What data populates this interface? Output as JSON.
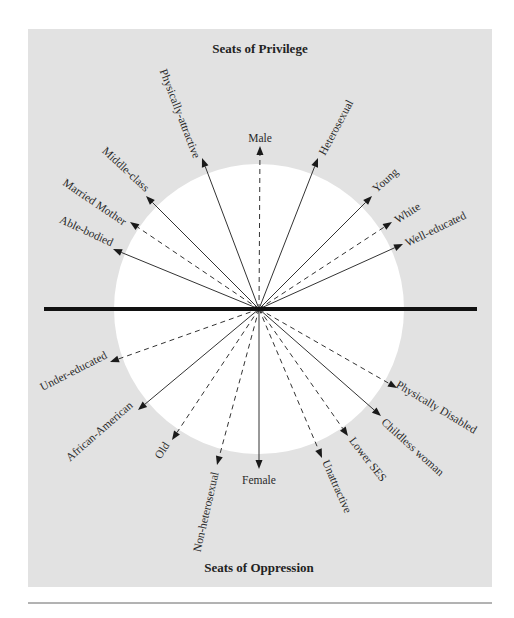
{
  "diagram": {
    "top_title": "Seats of Privilege",
    "bottom_title": "Seats of Oppression",
    "center": {
      "x": 259,
      "y": 309
    },
    "circle_radius": 145,
    "panel": {
      "x": 28,
      "y": 29,
      "width": 464,
      "height": 558
    },
    "axis_line": {
      "x1": 44,
      "x2": 477,
      "y": 309
    },
    "bottom_rule": {
      "x1": 28,
      "x2": 492,
      "y": 603
    },
    "colors": {
      "panel": "#e2e2e2",
      "circle": "#ffffff",
      "axis": "#111111",
      "arrow": "#333333"
    },
    "privilege_arrows": [
      {
        "label": "Able-bodied",
        "tip": [
          113,
          249
        ],
        "style": "solid",
        "label_pos": [
          86,
          232
        ],
        "label_angle": 25,
        "anchor": "middle"
      },
      {
        "label": "Married Mother",
        "tip": [
          130,
          222
        ],
        "style": "dashed",
        "label_pos": [
          94,
          203
        ],
        "label_angle": 34,
        "anchor": "middle"
      },
      {
        "label": "Middle-class",
        "tip": [
          146,
          196
        ],
        "style": "solid",
        "label_pos": [
          125,
          170
        ],
        "label_angle": 43,
        "anchor": "middle"
      },
      {
        "label": "Physically-attractive",
        "tip": [
          202,
          158
        ],
        "style": "solid",
        "label_pos": [
          179,
          114
        ],
        "label_angle": 69,
        "anchor": "middle"
      },
      {
        "label": "Male",
        "tip": [
          260,
          146
        ],
        "style": "dashed",
        "label_pos": [
          260,
          139
        ],
        "label_angle": 0,
        "anchor": "middle"
      },
      {
        "label": "Heterosexual",
        "tip": [
          318,
          158
        ],
        "style": "solid",
        "label_pos": [
          337,
          128
        ],
        "label_angle": -62,
        "anchor": "middle"
      },
      {
        "label": "Young",
        "tip": [
          372,
          196
        ],
        "style": "solid",
        "label_pos": [
          386,
          181
        ],
        "label_angle": -42,
        "anchor": "middle"
      },
      {
        "label": "White",
        "tip": [
          392,
          222
        ],
        "style": "dashed",
        "label_pos": [
          408,
          214
        ],
        "label_angle": -33,
        "anchor": "middle"
      },
      {
        "label": "Well-educated",
        "tip": [
          403,
          244
        ],
        "style": "solid",
        "label_pos": [
          436,
          230
        ],
        "label_angle": -26,
        "anchor": "middle"
      }
    ],
    "oppression_arrows": [
      {
        "label": "Under-educated",
        "tip": [
          110,
          362
        ],
        "style": "dashed",
        "label_pos": [
          74,
          372
        ],
        "label_angle": -27,
        "anchor": "middle"
      },
      {
        "label": "African-American",
        "tip": [
          138,
          410
        ],
        "style": "solid",
        "label_pos": [
          100,
          432
        ],
        "label_angle": -41,
        "anchor": "middle"
      },
      {
        "label": "Old",
        "tip": [
          172,
          440
        ],
        "style": "dashed",
        "label_pos": [
          163,
          451
        ],
        "label_angle": -57,
        "anchor": "middle"
      },
      {
        "label": "Non-heterosexual",
        "tip": [
          217,
          465
        ],
        "style": "dashed",
        "label_pos": [
          207,
          512
        ],
        "label_angle": -77,
        "anchor": "middle"
      },
      {
        "label": "Female",
        "tip": [
          259,
          469
        ],
        "style": "solid",
        "label_pos": [
          259,
          481
        ],
        "label_angle": 0,
        "anchor": "middle"
      },
      {
        "label": "Unattractive",
        "tip": [
          322,
          458
        ],
        "style": "dashed",
        "label_pos": [
          336,
          487
        ],
        "label_angle": 66,
        "anchor": "middle"
      },
      {
        "label": "Lower SES",
        "tip": [
          348,
          436
        ],
        "style": "dashed",
        "label_pos": [
          367,
          460
        ],
        "label_angle": 52,
        "anchor": "middle"
      },
      {
        "label": "Childless woman",
        "tip": [
          381,
          416
        ],
        "style": "solid",
        "label_pos": [
          412,
          448
        ],
        "label_angle": 42,
        "anchor": "middle"
      },
      {
        "label": "Physically Disabled",
        "tip": [
          397,
          388
        ],
        "style": "dashed",
        "label_pos": [
          436,
          408
        ],
        "label_angle": 31,
        "anchor": "middle"
      }
    ]
  }
}
